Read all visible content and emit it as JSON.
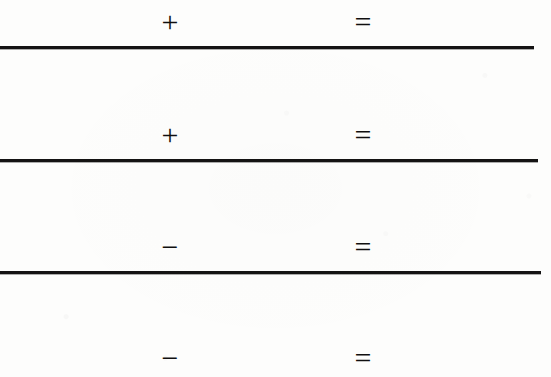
{
  "document": {
    "kind": "scanned-worksheet",
    "title": "Arithmetic problems worksheet",
    "page_background_color": "#fdfdfc",
    "ink_color": "#141313",
    "width": 551,
    "height": 377
  },
  "problems": [
    {
      "index": "1",
      "first_operand": "",
      "operator": "+",
      "operator_name": "plus-sign",
      "second_operand": "",
      "equals": "=",
      "answer": "",
      "has_rule_below": true
    },
    {
      "index": "2",
      "first_operand": "",
      "operator": "+",
      "operator_name": "plus-sign",
      "second_operand": "",
      "equals": "=",
      "answer": "",
      "has_rule_below": true
    },
    {
      "index": "3",
      "first_operand": "",
      "operator": "−",
      "operator_name": "minus-sign",
      "second_operand": "",
      "equals": "=",
      "answer": "",
      "has_rule_below": true
    },
    {
      "index": "4",
      "first_operand": "",
      "operator": "−",
      "operator_name": "minus-sign",
      "second_operand": "",
      "equals": "=",
      "answer": "",
      "has_rule_below": false
    }
  ],
  "rules": [
    {
      "index": "1",
      "left": 0,
      "top": 46,
      "width": 534,
      "height": 3
    },
    {
      "index": "2",
      "left": 0,
      "top": 159,
      "width": 538,
      "height": 3
    },
    {
      "index": "3",
      "left": 0,
      "top": 271,
      "width": 541,
      "height": 3
    }
  ],
  "layout": {
    "row_tops": [
      2,
      115,
      227,
      338
    ]
  }
}
